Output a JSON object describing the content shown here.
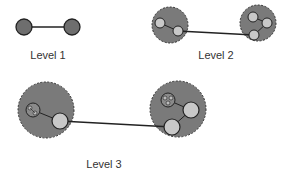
{
  "diagram": {
    "colors": {
      "node_dark": "#6e6e6e",
      "node_light": "#c8c8c8",
      "cluster_fill": "#7a7a7a",
      "stroke": "#222222",
      "edge": "#222222"
    },
    "levels": [
      {
        "label": "Level 1"
      },
      {
        "label": "Level 2"
      },
      {
        "label": "Level 3"
      }
    ]
  }
}
